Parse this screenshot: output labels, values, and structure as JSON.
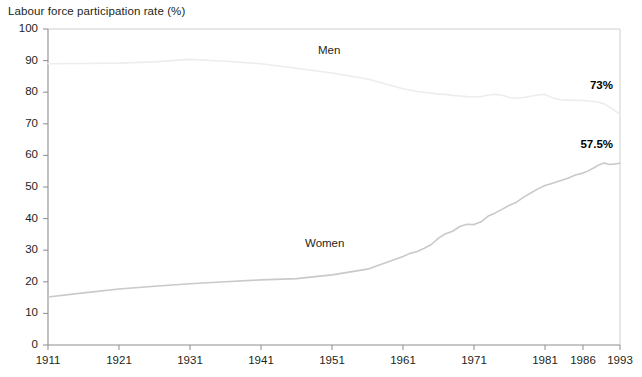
{
  "chart_data": {
    "type": "line",
    "title": "Labour force participation rate (%)",
    "xlabel": "",
    "ylabel": "Labour force participation rate (%)",
    "ylim": [
      0,
      100
    ],
    "ytick_labels": [
      "0",
      "10",
      "20",
      "30",
      "40",
      "50",
      "60",
      "70",
      "80",
      "90",
      "100"
    ],
    "ytick_values": [
      0,
      10,
      20,
      30,
      40,
      50,
      60,
      70,
      80,
      90,
      100
    ],
    "xtick_labels": [
      "1911",
      "1921",
      "1931",
      "1941",
      "1951",
      "1961",
      "1971",
      "1981",
      "1986",
      "1993"
    ],
    "xtick_values": [
      1911,
      1921,
      1931,
      1941,
      1951,
      1961,
      1971,
      1981,
      1986,
      1993
    ],
    "xlim": [
      1911,
      1993
    ],
    "grid": false,
    "legend": "inline-series-labels",
    "series": [
      {
        "name": "Men",
        "label": "Men",
        "color": "#ededed",
        "end_value_label": "73%",
        "x": [
          1911,
          1916,
          1921,
          1926,
          1931,
          1936,
          1941,
          1946,
          1951,
          1956,
          1961,
          1963,
          1965,
          1966,
          1967,
          1968,
          1969,
          1970,
          1971,
          1972,
          1973,
          1974,
          1975,
          1976,
          1977,
          1978,
          1979,
          1980,
          1981,
          1982,
          1983,
          1984,
          1985,
          1986,
          1987,
          1988,
          1989,
          1990,
          1991,
          1992,
          1993
        ],
        "values": [
          89.0,
          89.1,
          89.2,
          89.6,
          90.4,
          89.8,
          89.0,
          87.6,
          86.1,
          84.2,
          81.1,
          80.2,
          79.7,
          79.4,
          79.3,
          79.0,
          78.8,
          78.6,
          78.5,
          78.6,
          79.1,
          79.3,
          79.0,
          78.3,
          78.1,
          78.3,
          78.7,
          79.1,
          79.3,
          78.2,
          77.6,
          77.5,
          77.4,
          77.4,
          77.2,
          77.1,
          76.8,
          76.3,
          75.3,
          74.2,
          73.0
        ]
      },
      {
        "name": "Women",
        "label": "Women",
        "color": "#c9c9c9",
        "end_value_label": "57.5%",
        "x": [
          1911,
          1916,
          1921,
          1926,
          1931,
          1936,
          1941,
          1946,
          1951,
          1956,
          1961,
          1962,
          1963,
          1964,
          1965,
          1966,
          1967,
          1968,
          1969,
          1970,
          1971,
          1972,
          1973,
          1974,
          1975,
          1976,
          1977,
          1978,
          1979,
          1980,
          1981,
          1982,
          1983,
          1984,
          1985,
          1986,
          1987,
          1988,
          1989,
          1990,
          1991,
          1992,
          1993
        ],
        "values": [
          15.2,
          16.5,
          17.7,
          18.6,
          19.4,
          20.0,
          20.6,
          21.0,
          22.2,
          24.0,
          28.0,
          29.0,
          29.6,
          30.6,
          31.8,
          33.8,
          35.2,
          36.0,
          37.5,
          38.2,
          38.1,
          39.0,
          40.8,
          41.8,
          43.0,
          44.2,
          45.2,
          46.8,
          48.1,
          49.4,
          50.5,
          51.2,
          52.0,
          52.8,
          53.8,
          54.4,
          55.1,
          56.0,
          57.0,
          57.6,
          57.1,
          57.3,
          57.5
        ]
      }
    ]
  },
  "axis": {
    "y_title": "Labour force participation rate (%)"
  }
}
